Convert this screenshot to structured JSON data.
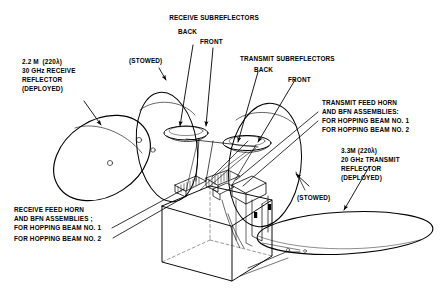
{
  "diagram": {
    "type": "technical-line-drawing",
    "background_color": "#ffffff",
    "line_color": "#000000",
    "text_color": "#000000"
  },
  "labels": {
    "receive_subreflectors": {
      "heading": "RECEIVE SUBREFLECTORS",
      "back": "BACK",
      "front": "FRONT"
    },
    "transmit_subreflectors": {
      "heading": "TRANSMIT SUBREFLECTORS",
      "back": "BACK",
      "front": "FRONT"
    },
    "receive_reflector": {
      "line1": "2.2 M  (220λ)",
      "line2": "30 GHz RECEIVE",
      "line3": "REFLECTOR",
      "line4": "(DEPLOYED)"
    },
    "transmit_reflector": {
      "line1": "3.3M (220λ)",
      "line2": "20 GHz TRANSMIT",
      "line3": "REFLECTOR",
      "line4": "(DEPLOYED)"
    },
    "transmit_feed": {
      "line1": "TRANSMIT FEED HORN",
      "line2": "AND BFN ASSEMBLIES:",
      "line3": "FOR HOPPING BEAM NO. 1",
      "line4": "FOR HOPPING BEAM NO. 2"
    },
    "receive_feed": {
      "line1": "RECEIVE FEED HORN",
      "line2": "AND BFN ASSEMBLIES ;",
      "line3": "FOR HOPPING BEAM NO. 1",
      "line4": "FOR HOPPING BEAM NO. 2"
    },
    "stowed_left": "(STOWED)",
    "stowed_right": "(STOWED)"
  }
}
